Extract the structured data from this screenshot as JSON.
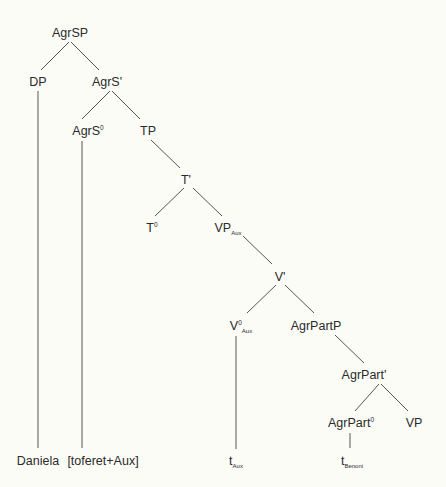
{
  "diagram": {
    "type": "syntax-tree",
    "line_color": "#555555",
    "text_color": "#2a2a2a",
    "background": "#fcfcf7",
    "nodes": [
      {
        "id": "AgrSP",
        "label": "AgrSP",
        "sup": "",
        "sub": "",
        "x": 70,
        "y": 33
      },
      {
        "id": "DP",
        "label": "DP",
        "sup": "",
        "sub": "",
        "x": 38,
        "y": 82
      },
      {
        "id": "AgrS_bar",
        "label": "AgrS'",
        "sup": "",
        "sub": "",
        "x": 107,
        "y": 82
      },
      {
        "id": "AgrS0",
        "label": "AgrS",
        "sup": "0",
        "sub": "",
        "x": 88,
        "y": 131
      },
      {
        "id": "TP",
        "label": "TP",
        "sup": "",
        "sub": "",
        "x": 148,
        "y": 131
      },
      {
        "id": "T_bar",
        "label": "T'",
        "sup": "",
        "sub": "",
        "x": 186,
        "y": 180
      },
      {
        "id": "T0",
        "label": "T",
        "sup": "0",
        "sub": "",
        "x": 152,
        "y": 228
      },
      {
        "id": "VP_Aux",
        "label": "VP",
        "sup": "",
        "sub": "Aux",
        "x": 228,
        "y": 228
      },
      {
        "id": "V_bar",
        "label": "V'",
        "sup": "",
        "sub": "",
        "x": 280,
        "y": 277
      },
      {
        "id": "V0_Aux",
        "label": "V",
        "sup": "0",
        "sub": "Aux",
        "x": 241,
        "y": 326
      },
      {
        "id": "AgrPartP",
        "label": "AgrPartP",
        "sup": "",
        "sub": "",
        "x": 316,
        "y": 326
      },
      {
        "id": "AgrPart_bar",
        "label": "AgrPart'",
        "sup": "",
        "sub": "",
        "x": 364,
        "y": 375
      },
      {
        "id": "AgrPart0",
        "label": "AgrPart",
        "sup": "0",
        "sub": "",
        "x": 351,
        "y": 423
      },
      {
        "id": "VP",
        "label": "VP",
        "sup": "",
        "sub": "",
        "x": 414,
        "y": 423
      },
      {
        "id": "Daniela",
        "label": "Daniela",
        "sup": "",
        "sub": "",
        "x": 38,
        "y": 461
      },
      {
        "id": "toferet",
        "label": "[toferet+Aux]",
        "sup": "",
        "sub": "",
        "x": 103,
        "y": 461
      },
      {
        "id": "t_Aux",
        "label": "t",
        "sup": "",
        "sub": "Aux",
        "x": 236,
        "y": 461
      },
      {
        "id": "t_Benoni",
        "label": "t",
        "sup": "",
        "sub": "Benoni",
        "x": 352,
        "y": 461
      }
    ],
    "edges": [
      {
        "from": "AgrSP",
        "to": "DP",
        "x1": 69,
        "y1": 42,
        "x2": 41,
        "y2": 70
      },
      {
        "from": "AgrSP",
        "to": "AgrS_bar",
        "x1": 71,
        "y1": 42,
        "x2": 99,
        "y2": 70
      },
      {
        "from": "DP",
        "to": "Daniela",
        "x1": 38,
        "y1": 91,
        "x2": 38,
        "y2": 448
      },
      {
        "from": "AgrS_bar",
        "to": "AgrS0",
        "x1": 110,
        "y1": 91,
        "x2": 82,
        "y2": 119
      },
      {
        "from": "AgrS_bar",
        "to": "TP",
        "x1": 112,
        "y1": 91,
        "x2": 140,
        "y2": 119
      },
      {
        "from": "AgrS0",
        "to": "toferet",
        "x1": 82,
        "y1": 141,
        "x2": 82,
        "y2": 448
      },
      {
        "from": "TP",
        "to": "T_bar",
        "x1": 151,
        "y1": 140,
        "x2": 180,
        "y2": 168
      },
      {
        "from": "T_bar",
        "to": "T0",
        "x1": 184,
        "y1": 188,
        "x2": 155,
        "y2": 216
      },
      {
        "from": "T_bar",
        "to": "VP_Aux",
        "x1": 193,
        "y1": 188,
        "x2": 222,
        "y2": 216
      },
      {
        "from": "VP_Aux",
        "to": "V_bar",
        "x1": 243,
        "y1": 236,
        "x2": 272,
        "y2": 264
      },
      {
        "from": "V_bar",
        "to": "V0_Aux",
        "x1": 276,
        "y1": 285,
        "x2": 247,
        "y2": 313
      },
      {
        "from": "V_bar",
        "to": "AgrPartP",
        "x1": 285,
        "y1": 285,
        "x2": 314,
        "y2": 313
      },
      {
        "from": "V0_Aux",
        "to": "t_Aux",
        "x1": 236,
        "y1": 336,
        "x2": 236,
        "y2": 449
      },
      {
        "from": "AgrPartP",
        "to": "AgrPart_bar",
        "x1": 335,
        "y1": 335,
        "x2": 364,
        "y2": 363
      },
      {
        "from": "AgrPart_bar",
        "to": "AgrPart0",
        "x1": 363,
        "y1": 384,
        "x2": 353,
        "y2": 399
      },
      {
        "from": "AgrPart_bar",
        "to": "AgrPart0b",
        "x1": 380,
        "y1": 374,
        "x2": 362,
        "y2": 399
      },
      {
        "from": "AgrPart_bar",
        "to": "VP",
        "x1": 382,
        "y1": 374,
        "x2": 408,
        "y2": 411
      },
      {
        "from": "AgrPart0",
        "to": "t_Benoni",
        "x1": 350,
        "y1": 433,
        "x2": 350,
        "y2": 448
      }
    ]
  }
}
